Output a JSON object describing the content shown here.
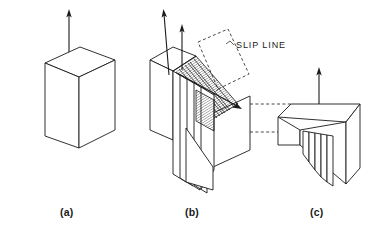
{
  "figure": {
    "background_color": "#ffffff",
    "line_color": "#1a1a1a",
    "panels": [
      {
        "id": "a",
        "caption": "(a)",
        "description": "Undeformed cubic crystal block with applied tensile load arrow",
        "arrows": 1
      },
      {
        "id": "b",
        "caption": "(b)",
        "description": "Crystal undergoing slip on parallel slip planes, hatched slip bands visible",
        "arrows": 2
      },
      {
        "id": "c",
        "caption": "(c)",
        "description": "Crystal after slip showing surface slip steps",
        "arrows": 1
      }
    ],
    "annotations": [
      {
        "name": "slip-line-label",
        "text": "SLIP  LINE"
      }
    ]
  }
}
